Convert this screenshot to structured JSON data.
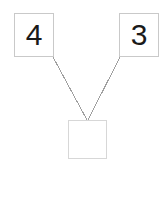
{
  "diagram": {
    "type": "number-bond",
    "background_color": "#ffffff",
    "width": 168,
    "height": 197,
    "nodes": [
      {
        "id": "addend-left",
        "role": "addend",
        "value": "4",
        "filled": true,
        "border_color": "#c9c9c9",
        "text_color": "#1a1a1a",
        "x": 14,
        "y": 13,
        "width": 40,
        "height": 44
      },
      {
        "id": "addend-right",
        "role": "addend",
        "value": "3",
        "filled": true,
        "border_color": "#c9c9c9",
        "text_color": "#1a1a1a",
        "x": 119,
        "y": 13,
        "width": 40,
        "height": 44
      },
      {
        "id": "sum",
        "role": "sum",
        "value": "",
        "filled": false,
        "border_color": "#d7d7d7",
        "text_color": "#1a1a1a",
        "x": 68,
        "y": 120,
        "width": 39,
        "height": 39
      }
    ],
    "connectors": [
      {
        "id": "connector-left",
        "from": "addend-left",
        "to": "sum",
        "x1": 53,
        "y1": 57,
        "x2": 87,
        "y2": 120,
        "color": "#a0a0a0",
        "width": 1
      },
      {
        "id": "connector-right",
        "from": "addend-right",
        "to": "sum",
        "x1": 120,
        "y1": 57,
        "x2": 88,
        "y2": 120,
        "color": "#a0a0a0",
        "width": 1
      }
    ]
  }
}
